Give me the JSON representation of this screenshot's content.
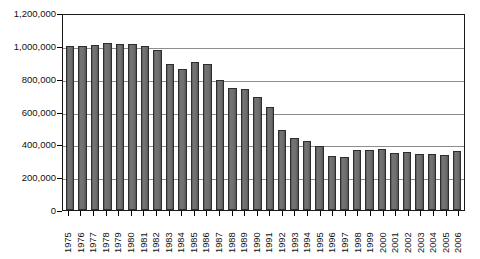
{
  "chart_data": {
    "type": "bar",
    "title": "",
    "subtitle": "",
    "xlabel": "",
    "ylabel": "",
    "ylim": [
      0,
      1200000
    ],
    "ytick_step": 200000,
    "grid": true,
    "legend": null,
    "bar_color": "#6b6b6b",
    "bar_border_color": "#2e2e2e",
    "axis_color": "#1a1a1a",
    "gridline_color": "#8d8d8d",
    "yticks": [
      "0",
      "200,000",
      "400,000",
      "600,000",
      "800,000",
      "1,000,000",
      "1,200,000"
    ],
    "ytick_values": [
      0,
      200000,
      400000,
      600000,
      800000,
      1000000,
      1200000
    ],
    "categories": [
      "1975",
      "1976",
      "1977",
      "1978",
      "1979",
      "1980",
      "1981",
      "1982",
      "1983",
      "1984",
      "1985",
      "1986",
      "1987",
      "1988",
      "1989",
      "1990",
      "1991",
      "1992",
      "1993",
      "1994",
      "1995",
      "1996",
      "1997",
      "1998",
      "1999",
      "2000",
      "2001",
      "2002",
      "2003",
      "2004",
      "2005",
      "2006"
    ],
    "values": [
      1000000,
      1000000,
      1005000,
      1020000,
      1010000,
      1010000,
      1000000,
      975000,
      890000,
      860000,
      900000,
      890000,
      795000,
      745000,
      735000,
      690000,
      630000,
      490000,
      440000,
      420000,
      390000,
      330000,
      325000,
      365000,
      365000,
      370000,
      350000,
      355000,
      340000,
      340000,
      335000,
      360000
    ]
  }
}
